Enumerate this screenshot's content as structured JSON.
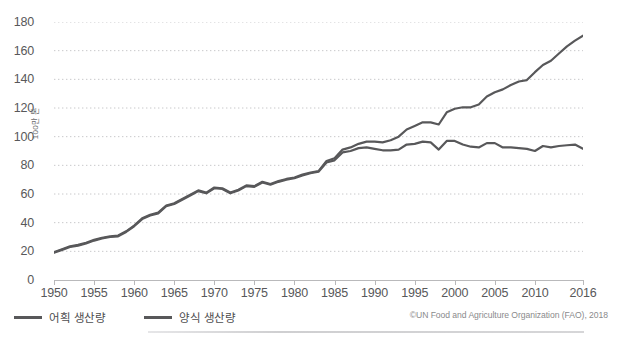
{
  "chart_data": {
    "type": "line",
    "title": "",
    "subtitle": "",
    "xlabel": "",
    "ylabel": "100만 톤",
    "ylim": [
      0,
      180
    ],
    "xlim": [
      1950,
      2016
    ],
    "grid": true,
    "grid_axis": "y",
    "legend_position": "bottom-left",
    "source": "©UN Food and Agriculture Organization (FAO), 2018",
    "ytick_labels": [
      "0",
      "20",
      "40",
      "60",
      "80",
      "100",
      "120",
      "140",
      "160",
      "180"
    ],
    "ytick_values": [
      0,
      20,
      40,
      60,
      80,
      100,
      120,
      140,
      160,
      180
    ],
    "xtick_labels": [
      "1950",
      "1955",
      "1960",
      "1965",
      "1970",
      "1975",
      "1980",
      "1985",
      "1990",
      "1995",
      "2000",
      "2005",
      "2010",
      "2016"
    ],
    "xtick_values": [
      1950,
      1955,
      1960,
      1965,
      1970,
      1975,
      1980,
      1985,
      1990,
      1995,
      2000,
      2005,
      2010,
      2016
    ],
    "x": [
      1950,
      1951,
      1952,
      1953,
      1954,
      1955,
      1956,
      1957,
      1958,
      1959,
      1960,
      1961,
      1962,
      1963,
      1964,
      1965,
      1966,
      1967,
      1968,
      1969,
      1970,
      1971,
      1972,
      1973,
      1974,
      1975,
      1976,
      1977,
      1978,
      1979,
      1980,
      1981,
      1982,
      1983,
      1984,
      1985,
      1986,
      1987,
      1988,
      1989,
      1990,
      1991,
      1992,
      1993,
      1994,
      1995,
      1996,
      1997,
      1998,
      1999,
      2000,
      2001,
      2002,
      2003,
      2004,
      2005,
      2006,
      2007,
      2008,
      2009,
      2010,
      2011,
      2012,
      2013,
      2014,
      2015,
      2016
    ],
    "series": [
      {
        "name": "양식 생산량",
        "color": "#58585a",
        "values": [
          19.5,
          21.5,
          23.5,
          24.5,
          26.0,
          28.0,
          29.5,
          30.5,
          31.0,
          34.0,
          38.0,
          43.0,
          45.5,
          47.0,
          52.0,
          53.5,
          56.5,
          59.5,
          62.5,
          61.0,
          64.5,
          64.0,
          61.0,
          63.0,
          66.0,
          65.5,
          68.5,
          67.0,
          69.0,
          70.5,
          71.5,
          73.5,
          75.0,
          76.0,
          83.0,
          85.0,
          91.0,
          92.5,
          95.0,
          96.5,
          96.5,
          96.0,
          97.5,
          100.0,
          105.0,
          107.5,
          110.0,
          110.0,
          108.5,
          117.0,
          119.5,
          120.5,
          120.5,
          122.5,
          128.0,
          131.0,
          133.0,
          136.0,
          138.5,
          139.5,
          145.0,
          150.0,
          153.0,
          158.0,
          163.0,
          167.0,
          170.5
        ]
      },
      {
        "name": "어획 생산량",
        "color": "#58585a",
        "values": [
          19.0,
          21.0,
          23.0,
          24.0,
          25.5,
          27.5,
          29.0,
          30.0,
          30.5,
          33.5,
          37.5,
          42.5,
          45.0,
          46.5,
          51.5,
          53.0,
          56.0,
          59.0,
          62.0,
          60.5,
          64.0,
          63.5,
          60.5,
          62.5,
          65.5,
          65.0,
          68.0,
          66.5,
          68.5,
          70.0,
          71.0,
          73.0,
          74.5,
          75.5,
          82.0,
          83.5,
          89.0,
          90.0,
          92.0,
          92.5,
          91.5,
          90.5,
          90.5,
          91.0,
          94.5,
          95.0,
          96.5,
          96.0,
          91.0,
          97.0,
          97.0,
          94.5,
          93.0,
          92.5,
          95.5,
          95.5,
          92.5,
          92.5,
          92.0,
          91.5,
          90.0,
          93.5,
          92.5,
          93.5,
          94.0,
          94.5,
          91.5
        ]
      }
    ],
    "legend": [
      {
        "label": "어획 생산량",
        "color": "#58585a"
      },
      {
        "label": "양식 생산량",
        "color": "#58585a"
      }
    ]
  },
  "colors": {
    "line": "#58585a",
    "grid": "#c8c8ca",
    "axis": "#b9b9bb",
    "text": "#58585a",
    "source_text": "#8a8a8c"
  }
}
